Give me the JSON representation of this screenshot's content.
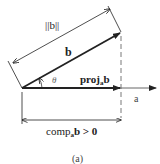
{
  "diagram": {
    "type": "vector-projection",
    "labels": {
      "norm_b": "||b||",
      "vector_b": "b",
      "angle": "θ",
      "proj_main": "proj",
      "proj_sub": "a",
      "proj_vec": "b",
      "axis_a": "a",
      "comp_main": "comp",
      "comp_sub": "a",
      "comp_tail": "b > 0",
      "caption": "(a)"
    },
    "colors": {
      "ink": "#222222",
      "dashed": "#555555"
    }
  }
}
